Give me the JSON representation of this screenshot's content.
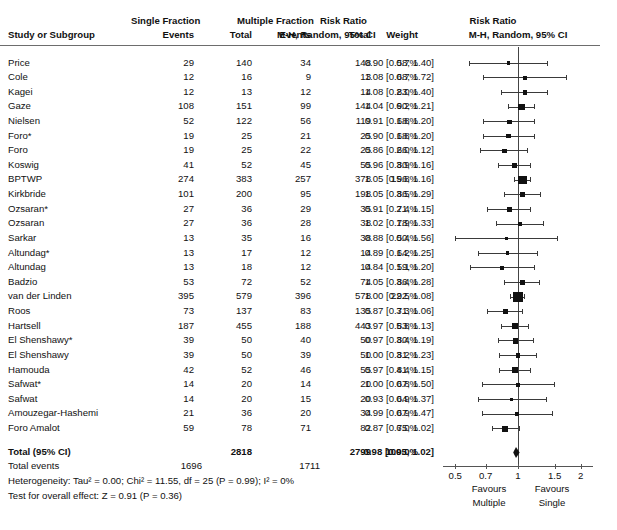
{
  "figure": {
    "type": "forest-plot"
  },
  "header": {
    "study_col": "Study or Subgroup",
    "group1": "Single Fraction",
    "group2": "Multiple Fraction",
    "events": "Events",
    "total": "Total",
    "weight": "Weight",
    "rr_title": "Risk Ratio",
    "rr_sub": "M-H, Random, 95% CI",
    "plot_title": "Risk Ratio",
    "plot_sub": "M-H, Random, 95% CI"
  },
  "axis": {
    "ticks": [
      "0.5",
      "0.7",
      "1",
      "1.5",
      "2"
    ],
    "tick_values": [
      0.5,
      0.7,
      1,
      1.5,
      2
    ],
    "left_label_1": "Favours",
    "left_label_2": "Multiple",
    "right_label_1": "Favours",
    "right_label_2": "Single",
    "scale": "log",
    "null_value": 1
  },
  "totals": {
    "label": "Total (95% CI)",
    "total1": "2818",
    "total2": "2799",
    "weight": "100.0%",
    "rr": "0.98 [0.95, 1.02]",
    "events_label": "Total events",
    "events1": "1696",
    "events2": "1711",
    "heterogeneity": "Heterogeneity: Tau² = 0.00; Chi² = 11.55, df = 25 (P = 0.99); I² = 0%",
    "overall": "Test for overall effect: Z = 0.91 (P = 0.36)",
    "effect": 0.98,
    "lower": 0.95,
    "upper": 1.02
  },
  "chart_data": {
    "type": "forest",
    "title": "Risk Ratio",
    "subtitle": "M-H, Random, 95% CI",
    "xlabel": "",
    "ylabel": "",
    "xscale": "log",
    "xlim": [
      0.45,
      2.2
    ],
    "xticks": [
      0.5,
      0.7,
      1,
      1.5,
      2
    ],
    "columns": [
      "Study or Subgroup",
      "Events",
      "Total",
      "Events",
      "Total",
      "Weight",
      "M-H, Random, 95% CI"
    ],
    "rows": [
      {
        "study": "Price",
        "e1": "29",
        "n1": "140",
        "e2": "34",
        "n2": "148",
        "weight": "0.7%",
        "w": 0.7,
        "rr": "0.90 [0.58, 1.40]",
        "est": 0.9,
        "lo": 0.58,
        "hi": 1.4
      },
      {
        "study": "Cole",
        "e1": "12",
        "n1": "16",
        "e2": "9",
        "n2": "13",
        "weight": "0.7%",
        "w": 0.7,
        "rr": "1.08 [0.68, 1.72]",
        "est": 1.08,
        "lo": 0.68,
        "hi": 1.72
      },
      {
        "study": "Kagei",
        "e1": "12",
        "n1": "13",
        "e2": "12",
        "n2": "14",
        "weight": "2.0%",
        "w": 2.0,
        "rr": "1.08 [0.83, 1.40]",
        "est": 1.08,
        "lo": 0.83,
        "hi": 1.4
      },
      {
        "study": "Gaze",
        "e1": "108",
        "n1": "151",
        "e2": "99",
        "n2": "144",
        "weight": "6.2%",
        "w": 6.2,
        "rr": "1.04 [0.90, 1.21]",
        "est": 1.04,
        "lo": 0.9,
        "hi": 1.21
      },
      {
        "study": "Nielsen",
        "e1": "52",
        "n1": "122",
        "e2": "56",
        "n2": "119",
        "weight": "1.8%",
        "w": 1.8,
        "rr": "0.91 [0.68, 1.20]",
        "est": 0.91,
        "lo": 0.68,
        "hi": 1.2
      },
      {
        "study": "Foro*",
        "e1": "19",
        "n1": "25",
        "e2": "21",
        "n2": "25",
        "weight": "1.8%",
        "w": 1.8,
        "rr": "0.90 [0.68, 1.20]",
        "est": 0.9,
        "lo": 0.68,
        "hi": 1.2
      },
      {
        "study": "Foro",
        "e1": "19",
        "n1": "25",
        "e2": "22",
        "n2": "25",
        "weight": "2.0%",
        "w": 2.0,
        "rr": "0.86 [0.66, 1.12]",
        "est": 0.86,
        "lo": 0.66,
        "hi": 1.12
      },
      {
        "study": "Koswig",
        "e1": "41",
        "n1": "52",
        "e2": "45",
        "n2": "55",
        "weight": "3.9%",
        "w": 3.9,
        "rr": "0.96 [0.80, 1.16]",
        "est": 0.96,
        "lo": 0.8,
        "hi": 1.16
      },
      {
        "study": "BPTWP",
        "e1": "274",
        "n1": "383",
        "e2": "257",
        "n2": "378",
        "weight": "15.8%",
        "w": 15.8,
        "rr": "1.05 [0.96, 1.16]",
        "est": 1.05,
        "lo": 0.96,
        "hi": 1.16
      },
      {
        "study": "Kirkbride",
        "e1": "101",
        "n1": "200",
        "e2": "95",
        "n2": "198",
        "weight": "3.5%",
        "w": 3.5,
        "rr": "1.05 [0.86, 1.29]",
        "est": 1.05,
        "lo": 0.86,
        "hi": 1.29
      },
      {
        "study": "Ozsaran*",
        "e1": "27",
        "n1": "36",
        "e2": "29",
        "n2": "35",
        "weight": "2.4%",
        "w": 2.4,
        "rr": "0.91 [0.71, 1.15]",
        "est": 0.91,
        "lo": 0.71,
        "hi": 1.15
      },
      {
        "study": "Ozsaran",
        "e1": "27",
        "n1": "36",
        "e2": "28",
        "n2": "38",
        "weight": "1.9%",
        "w": 1.9,
        "rr": "1.02 [0.78, 1.33]",
        "est": 1.02,
        "lo": 0.78,
        "hi": 1.33
      },
      {
        "study": "Sarkar",
        "e1": "13",
        "n1": "35",
        "e2": "16",
        "n2": "38",
        "weight": "0.4%",
        "w": 0.4,
        "rr": "0.88 [0.50, 1.56]",
        "est": 0.88,
        "lo": 0.5,
        "hi": 1.56
      },
      {
        "study": "Altundag*",
        "e1": "13",
        "n1": "17",
        "e2": "12",
        "n2": "14",
        "weight": "1.2%",
        "w": 1.2,
        "rr": "0.89 [0.64, 1.25]",
        "est": 0.89,
        "lo": 0.64,
        "hi": 1.25
      },
      {
        "study": "Altundag",
        "e1": "13",
        "n1": "18",
        "e2": "12",
        "n2": "14",
        "weight": "1.1%",
        "w": 1.1,
        "rr": "0.84 [0.59, 1.20]",
        "est": 0.84,
        "lo": 0.59,
        "hi": 1.2
      },
      {
        "study": "Badzio",
        "e1": "53",
        "n1": "72",
        "e2": "52",
        "n2": "74",
        "weight": "3.4%",
        "w": 3.4,
        "rr": "1.05 [0.86, 1.28]",
        "est": 1.05,
        "lo": 0.86,
        "hi": 1.28
      },
      {
        "study": "van der Linden",
        "e1": "395",
        "n1": "579",
        "e2": "396",
        "n2": "578",
        "weight": "22.5%",
        "w": 22.5,
        "rr": "1.00 [0.92, 1.08]",
        "est": 1.0,
        "lo": 0.92,
        "hi": 1.08
      },
      {
        "study": "Roos",
        "e1": "73",
        "n1": "137",
        "e2": "83",
        "n2": "135",
        "weight": "3.3%",
        "w": 3.3,
        "rr": "0.87 [0.71, 1.06]",
        "est": 0.87,
        "lo": 0.71,
        "hi": 1.06
      },
      {
        "study": "Hartsell",
        "e1": "187",
        "n1": "455",
        "e2": "188",
        "n2": "443",
        "weight": "5.8%",
        "w": 5.8,
        "rr": "0.97 [0.83, 1.13]",
        "est": 0.97,
        "lo": 0.83,
        "hi": 1.13
      },
      {
        "study": "El Shenshawy*",
        "e1": "39",
        "n1": "50",
        "e2": "40",
        "n2": "50",
        "weight": "3.4%",
        "w": 3.4,
        "rr": "0.97 [0.80, 1.19]",
        "est": 0.97,
        "lo": 0.8,
        "hi": 1.19
      },
      {
        "study": "El Shenshawy",
        "e1": "39",
        "n1": "50",
        "e2": "39",
        "n2": "50",
        "weight": "3.2%",
        "w": 3.2,
        "rr": "1.00 [0.81, 1.23]",
        "est": 1.0,
        "lo": 0.81,
        "hi": 1.23
      },
      {
        "study": "Hamouda",
        "e1": "42",
        "n1": "52",
        "e2": "46",
        "n2": "55",
        "weight": "4.4%",
        "w": 4.4,
        "rr": "0.97 [0.81, 1.15]",
        "est": 0.97,
        "lo": 0.81,
        "hi": 1.15
      },
      {
        "study": "Safwat*",
        "e1": "14",
        "n1": "20",
        "e2": "14",
        "n2": "20",
        "weight": "0.8%",
        "w": 0.8,
        "rr": "1.00 [0.67, 1.50]",
        "est": 1.0,
        "lo": 0.67,
        "hi": 1.5
      },
      {
        "study": "Safwat",
        "e1": "14",
        "n1": "20",
        "e2": "15",
        "n2": "20",
        "weight": "0.9%",
        "w": 0.9,
        "rr": "0.93 [0.64, 1.37]",
        "est": 0.93,
        "lo": 0.64,
        "hi": 1.37
      },
      {
        "study": "Amouzegar-Hashemi",
        "e1": "21",
        "n1": "36",
        "e2": "20",
        "n2": "34",
        "weight": "0.9%",
        "w": 0.9,
        "rr": "0.99 [0.67, 1.47]",
        "est": 0.99,
        "lo": 0.67,
        "hi": 1.47
      },
      {
        "study": "Foro Amalot",
        "e1": "59",
        "n1": "78",
        "e2": "71",
        "n2": "82",
        "weight": "6.0%",
        "w": 6.0,
        "rr": "0.87 [0.75, 1.02]",
        "est": 0.87,
        "lo": 0.75,
        "hi": 1.02
      }
    ]
  }
}
